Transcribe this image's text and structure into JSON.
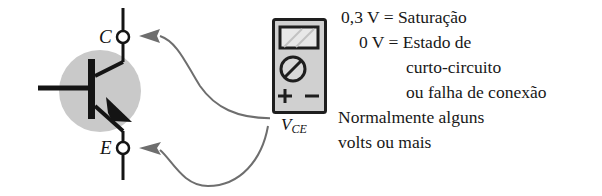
{
  "figure": {
    "type": "transistor-voltage-measurement-diagram",
    "transistor": {
      "collector_label": "C",
      "emitter_label": "E"
    },
    "meter": {
      "name": "multimeter",
      "positive_terminal": "+",
      "negative_terminal": "–",
      "measured_quantity": "V",
      "measured_quantity_subscript": "CE"
    },
    "colors": {
      "transistor_body_fill": "#c9c9c9",
      "meter_body_fill": "#d0d0d0",
      "meter_screen_fill": "#e3e3e3",
      "line_stroke": "#141414",
      "arrow_stroke": "#6e6e6e"
    }
  },
  "annotations": {
    "lines": [
      "0,3 V = Saturação",
      "0 V = Estado de",
      "curto-circuito",
      "ou falha de conexão",
      "Normalmente alguns",
      "volts ou mais"
    ]
  }
}
